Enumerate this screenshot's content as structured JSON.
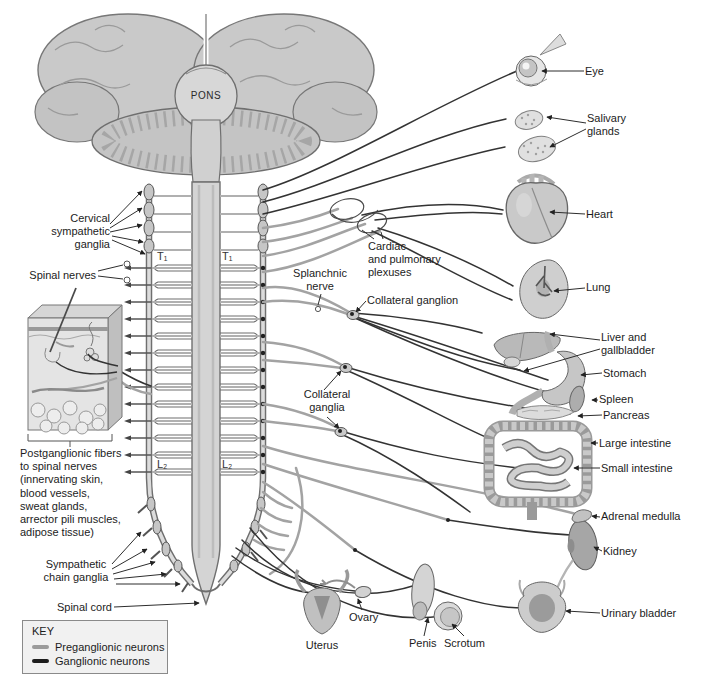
{
  "labels": {
    "pons": "PONS",
    "cervical_sympathetic_ganglia": "Cervical\nsympathetic\nganglia",
    "spinal_nerves": "Spinal nerves",
    "t1": "T₁",
    "l2": "L₂",
    "splanchnic_nerve": "Splanchnic\nnerve",
    "cardiac_pulmonary_plexuses": "Cardiac\nand pulmonary\nplexuses",
    "collateral_ganglion": "Collateral ganglion",
    "collateral_ganglia": "Collateral\nganglia",
    "postganglionic_fibers_note": "Postganglionic fibers\nto spinal nerves\n(innervating skin,\nblood vessels,\nsweat glands,\narrector pili muscles,\nadipose tissue)",
    "sympathetic_chain_ganglia": "Sympathetic\nchain ganglia",
    "spinal_cord": "Spinal cord",
    "uterus": "Uterus",
    "ovary": "Ovary",
    "penis": "Penis",
    "scrotum": "Scrotum"
  },
  "organ_labels": [
    {
      "name": "eye",
      "label": "Eye"
    },
    {
      "name": "salivary-glands",
      "label": "Salivary\nglands"
    },
    {
      "name": "heart",
      "label": "Heart"
    },
    {
      "name": "lung",
      "label": "Lung"
    },
    {
      "name": "liver-gallbladder",
      "label": "Liver and\ngallbladder"
    },
    {
      "name": "stomach",
      "label": "Stomach"
    },
    {
      "name": "spleen",
      "label": "Spleen"
    },
    {
      "name": "pancreas",
      "label": "Pancreas"
    },
    {
      "name": "large-intestine",
      "label": "Large intestine"
    },
    {
      "name": "small-intestine",
      "label": "Small intestine"
    },
    {
      "name": "adrenal-medulla",
      "label": "Adrenal medulla"
    },
    {
      "name": "kidney",
      "label": "Kidney"
    },
    {
      "name": "urinary-bladder",
      "label": "Urinary bladder"
    }
  ],
  "key": {
    "title": "KEY",
    "items": [
      {
        "label": "Preganglionic neurons",
        "color": "#9b9b9b"
      },
      {
        "label": "Ganglionic neurons",
        "color": "#1d1d1d"
      }
    ]
  }
}
